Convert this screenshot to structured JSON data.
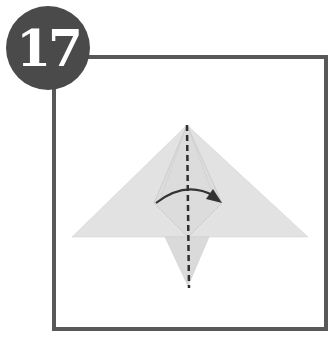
{
  "step": {
    "number": "17"
  },
  "diagram": {
    "paper_color": "#e2e2e2",
    "paper_shade": "#d6d6d6",
    "line_color": "#2f2f2f",
    "frame_color": "#585858",
    "badge_color": "#4a4a4a",
    "instructions": [
      {
        "type": "valley-fold-line",
        "orientation": "vertical"
      },
      {
        "type": "arrow",
        "direction": "left-to-right"
      }
    ]
  }
}
